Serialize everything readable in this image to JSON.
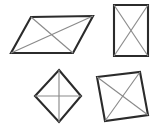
{
  "figure": {
    "background_color": "#ffffff",
    "outline_color": "#2b2b2b",
    "diagonal_color": "#8a8a8a",
    "outline_width": 2.1,
    "diagonal_width": 1.15,
    "canvas": {
      "width": 158,
      "height": 131
    },
    "shapes": [
      {
        "id": "parallelogram",
        "label": "parallelogram",
        "position": "top-left",
        "vertices": "31,17 93,16 73,53 11,53",
        "diagonal_a": {
          "x1": 31,
          "y1": 17,
          "x2": 73,
          "y2": 53
        },
        "diagonal_b": {
          "x1": 93,
          "y1": 16,
          "x2": 11,
          "y2": 53
        }
      },
      {
        "id": "rectangle",
        "label": "rectangle",
        "position": "top-right",
        "vertices": "114,5 148,5 148,56 114,56",
        "diagonal_a": {
          "x1": 114,
          "y1": 5,
          "x2": 148,
          "y2": 56
        },
        "diagonal_b": {
          "x1": 148,
          "y1": 5,
          "x2": 114,
          "y2": 56
        }
      },
      {
        "id": "rhombus-diamond",
        "label": "rhombus",
        "position": "bottom-left",
        "vertices": "59,70 81,96 59,122 35,96",
        "diagonal_a": {
          "x1": 59,
          "y1": 70,
          "x2": 59,
          "y2": 122
        },
        "diagonal_b": {
          "x1": 35,
          "y1": 96,
          "x2": 81,
          "y2": 96
        }
      },
      {
        "id": "rhombus-slanted",
        "label": "rhombus",
        "position": "bottom-right",
        "vertices": "97,77 140,72 148,115 105,121",
        "diagonal_a": {
          "x1": 97,
          "y1": 77,
          "x2": 148,
          "y2": 115
        },
        "diagonal_b": {
          "x1": 140,
          "y1": 72,
          "x2": 105,
          "y2": 121
        }
      }
    ]
  }
}
